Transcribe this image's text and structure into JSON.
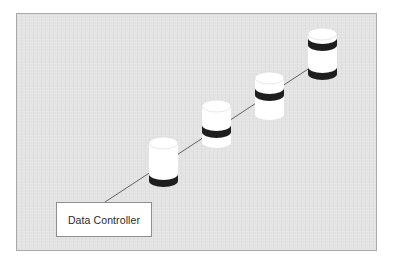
{
  "diagram": {
    "type": "disk-striping",
    "controller": {
      "label": "Data Controller"
    },
    "disks": [
      {
        "name": "disk-1",
        "band_positions": [
          "bottom"
        ]
      },
      {
        "name": "disk-2",
        "band_positions": [
          "lower-middle"
        ]
      },
      {
        "name": "disk-3",
        "band_positions": [
          "upper-middle"
        ]
      },
      {
        "name": "disk-4",
        "band_positions": [
          "top",
          "bottom"
        ]
      }
    ],
    "colors": {
      "background": "#e3e3e3",
      "frame_border": "#a9a9a9",
      "disk_body": "#ffffff",
      "disk_band": "#1e1e1e",
      "connector_line": "#555555"
    }
  }
}
